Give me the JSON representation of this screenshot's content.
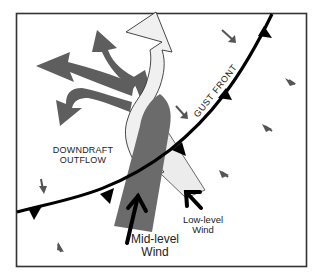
{
  "diagram": {
    "labels": {
      "downdraft_line1": "DOWNDRAFT",
      "downdraft_line2": "OUTFLOW",
      "gust_front": "GUST FRONT",
      "mid_level_line1": "Mid-level",
      "mid_level_line2": "Wind",
      "low_level_line1": "Low-level",
      "low_level_line2": "Wind"
    },
    "colors": {
      "frame": "#333333",
      "downdraft_arrows": "#5e5e5e",
      "mid_level_band": "#6b6b6b",
      "updraft_arrow_fill": "#f0f0f0",
      "gust_front_line": "#000000",
      "small_arrows": "#555555"
    },
    "elements": [
      {
        "name": "downdraft-outflow-arrows",
        "count": 4
      },
      {
        "name": "updraft-white-arrow"
      },
      {
        "name": "mid-level-wind-band"
      },
      {
        "name": "low-level-wind-band"
      },
      {
        "name": "gust-front-line",
        "barbs": 5
      },
      {
        "name": "small-wind-arrows",
        "count": 7
      },
      {
        "name": "mid-level-wind-arrow"
      },
      {
        "name": "low-level-wind-arrow"
      }
    ]
  }
}
